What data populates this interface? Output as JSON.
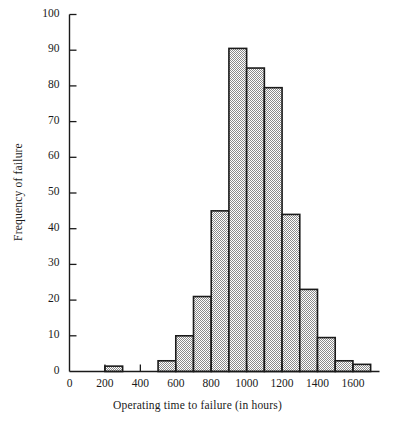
{
  "chart_data": {
    "type": "bar",
    "title": "",
    "subtitle": "",
    "xlabel": "Operating time to failure (in hours)",
    "ylabel": "Frequency of failure",
    "xlim": [
      0,
      1750
    ],
    "ylim": [
      0,
      100
    ],
    "grid": false,
    "legend": null,
    "bin_width": 100,
    "xtick_labels": [
      "0",
      "200",
      "400",
      "600",
      "800",
      "1000",
      "1200",
      "1400",
      "1600"
    ],
    "xtick_values": [
      0,
      200,
      400,
      600,
      800,
      1000,
      1200,
      1400,
      1600
    ],
    "ytick_labels": [
      "0",
      "10",
      "20",
      "30",
      "40",
      "50",
      "60",
      "70",
      "80",
      "90",
      "100"
    ],
    "ytick_values": [
      0,
      10,
      20,
      30,
      40,
      50,
      60,
      70,
      80,
      90,
      100
    ],
    "bin_edges": [
      200,
      300,
      400,
      500,
      600,
      700,
      800,
      900,
      1000,
      1100,
      1200,
      1300,
      1400,
      1500,
      1600,
      1700
    ],
    "categories": [
      "200-300",
      "300-400",
      "400-500",
      "500-600",
      "600-700",
      "700-800",
      "800-900",
      "900-1000",
      "1000-1100",
      "1100-1200",
      "1200-1300",
      "1300-1400",
      "1400-1500",
      "1500-1600",
      "1600-1700"
    ],
    "values": [
      1.5,
      0,
      0,
      3,
      10,
      21,
      45,
      90.5,
      85,
      79.5,
      44,
      23,
      9.5,
      3,
      2
    ],
    "bar_fill": "#cfcfcf",
    "bar_edge": "#1a1a1a",
    "axis_color": "#1a1a1a",
    "background": "#ffffff"
  }
}
